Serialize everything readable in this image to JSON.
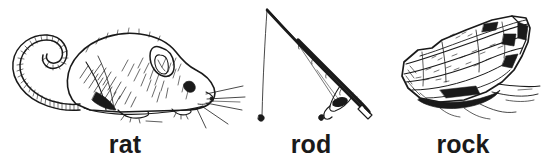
{
  "page": {
    "kind": "illustrated-vocabulary-card",
    "background_color": "#ffffff",
    "ink_color": "#1a1a1a",
    "width_px": 546,
    "height_px": 166
  },
  "items": [
    {
      "id": "rat",
      "label": "rat",
      "illustration_name": "rat-illustration",
      "description": "pen-and-ink side view of a rat facing right with long ringed tail curling up to the left"
    },
    {
      "id": "rod",
      "label": "rod",
      "illustration_name": "rod-illustration",
      "description": "pen-and-ink fishing rod bent from upper left down to lower right with reel and hanging line"
    },
    {
      "id": "rock",
      "label": "rock",
      "illustration_name": "rock-illustration",
      "description": "pen-and-ink angular layered boulder resting on ground lines"
    }
  ]
}
